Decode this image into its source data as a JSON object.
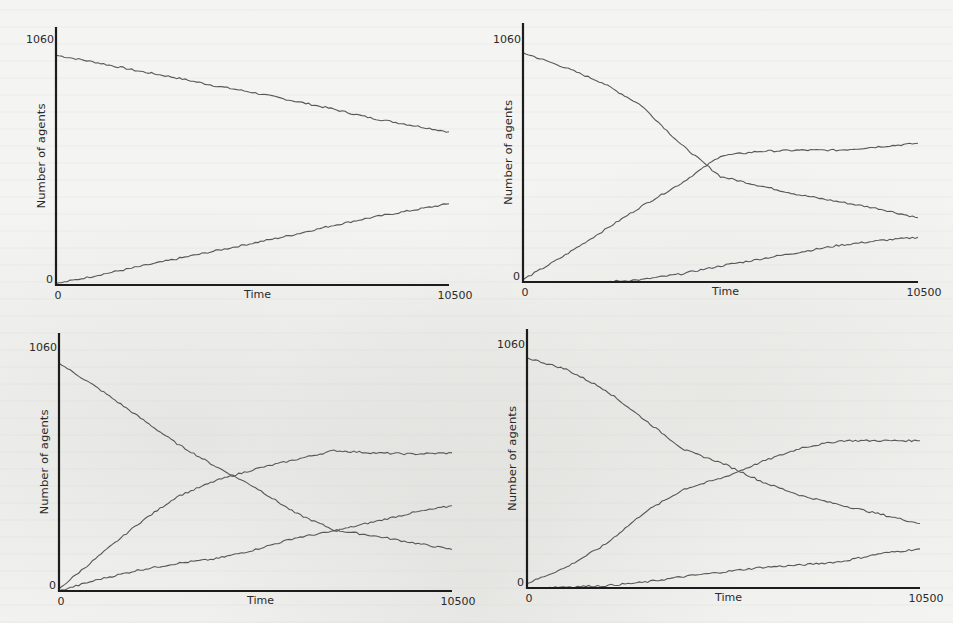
{
  "figure": {
    "line_color": "#585858",
    "axis_color": "#1c1c1c",
    "background_color": "#f4f4f2"
  },
  "chart_data": [
    {
      "type": "line",
      "panel": "top-left",
      "title": "",
      "xlabel": "Time",
      "ylabel": "Number of agents",
      "xlim": [
        0,
        10500
      ],
      "ylim": [
        0,
        1060
      ],
      "x_ticks": [
        "0",
        "10500"
      ],
      "y_ticks": [
        "0",
        "1060"
      ],
      "grid": false,
      "legend": "none",
      "x": [
        0,
        1050,
        2100,
        3150,
        4200,
        5250,
        6300,
        7350,
        8400,
        9450,
        10500
      ],
      "series": [
        {
          "name": "series-1",
          "values": [
            990,
            960,
            925,
            895,
            860,
            830,
            795,
            760,
            720,
            690,
            660
          ]
        },
        {
          "name": "series-2",
          "values": [
            5,
            40,
            75,
            110,
            145,
            180,
            215,
            255,
            290,
            320,
            350
          ]
        }
      ]
    },
    {
      "type": "line",
      "panel": "top-right",
      "title": "",
      "xlabel": "Time",
      "ylabel": "Number of agents",
      "xlim": [
        0,
        10500
      ],
      "ylim": [
        0,
        1060
      ],
      "x_ticks": [
        "0",
        "10500"
      ],
      "y_ticks": [
        "0",
        "1060"
      ],
      "grid": false,
      "legend": "none",
      "x": [
        0,
        1050,
        2100,
        3150,
        4200,
        5250,
        6300,
        7350,
        8400,
        9450,
        10500
      ],
      "series": [
        {
          "name": "series-1",
          "values": [
            1000,
            940,
            870,
            770,
            600,
            460,
            420,
            380,
            350,
            320,
            280
          ]
        },
        {
          "name": "series-2",
          "values": [
            10,
            110,
            220,
            330,
            430,
            550,
            570,
            575,
            575,
            590,
            605
          ]
        },
        {
          "name": "series-3",
          "values": [
            0,
            0,
            0,
            10,
            35,
            70,
            100,
            130,
            160,
            180,
            195
          ]
        }
      ]
    },
    {
      "type": "line",
      "panel": "bottom-left",
      "title": "",
      "xlabel": "Time",
      "ylabel": "Number of agents",
      "xlim": [
        0,
        10500
      ],
      "ylim": [
        0,
        1060
      ],
      "x_ticks": [
        "0",
        "10500"
      ],
      "y_ticks": [
        "0",
        "1060"
      ],
      "grid": false,
      "legend": "none",
      "x": [
        0,
        1050,
        2100,
        3150,
        4200,
        5250,
        6300,
        7350,
        8400,
        9450,
        10500
      ],
      "series": [
        {
          "name": "series-1",
          "values": [
            990,
            880,
            760,
            640,
            540,
            450,
            340,
            265,
            240,
            210,
            180
          ]
        },
        {
          "name": "series-2",
          "values": [
            10,
            150,
            290,
            410,
            480,
            530,
            570,
            610,
            600,
            595,
            600
          ]
        },
        {
          "name": "series-3",
          "values": [
            0,
            50,
            90,
            120,
            140,
            180,
            230,
            260,
            300,
            340,
            370
          ]
        }
      ]
    },
    {
      "type": "line",
      "panel": "bottom-right",
      "title": "",
      "xlabel": "Time",
      "ylabel": "Number of agents",
      "xlim": [
        0,
        10500
      ],
      "ylim": [
        0,
        1060
      ],
      "x_ticks": [
        "0",
        "10500"
      ],
      "y_ticks": [
        "0",
        "1060"
      ],
      "grid": false,
      "legend": "none",
      "x": [
        0,
        1050,
        2100,
        3150,
        4200,
        5250,
        6300,
        7350,
        8400,
        9450,
        10500
      ],
      "series": [
        {
          "name": "series-1",
          "values": [
            1000,
            950,
            860,
            730,
            600,
            540,
            460,
            400,
            360,
            320,
            280
          ]
        },
        {
          "name": "series-2",
          "values": [
            20,
            90,
            190,
            330,
            430,
            480,
            550,
            610,
            640,
            640,
            640
          ]
        },
        {
          "name": "series-3",
          "values": [
            0,
            5,
            10,
            25,
            50,
            70,
            90,
            100,
            115,
            150,
            170
          ]
        }
      ]
    }
  ]
}
